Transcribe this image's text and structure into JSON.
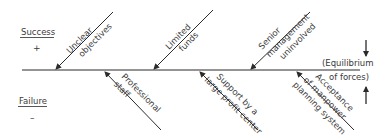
{
  "diagram": {
    "type": "force-field",
    "left_labels": {
      "top": {
        "text": "Success",
        "sign": "+"
      },
      "bottom": {
        "text": "Failure",
        "sign": "–"
      }
    },
    "equilibrium": {
      "line1": "(Equilibrium",
      "line2": "of forces)"
    },
    "restraining_forces": [
      {
        "line1": "Unclear",
        "line2": "objectives"
      },
      {
        "line1": "Limited",
        "line2": "funds"
      },
      {
        "line1": "Senior",
        "line2": "management",
        "line3": "uninvolved"
      }
    ],
    "driving_forces": [
      {
        "line1": "Professional",
        "line2": "staff"
      },
      {
        "line1": "Support by a",
        "line2": "large profit center"
      },
      {
        "line1": "Acceptance",
        "line2": "of manpower",
        "line3": "planning system"
      }
    ],
    "colors": {
      "line": "#2b2b2b",
      "text": "#3a3a3a",
      "background": "#ffffff"
    }
  }
}
